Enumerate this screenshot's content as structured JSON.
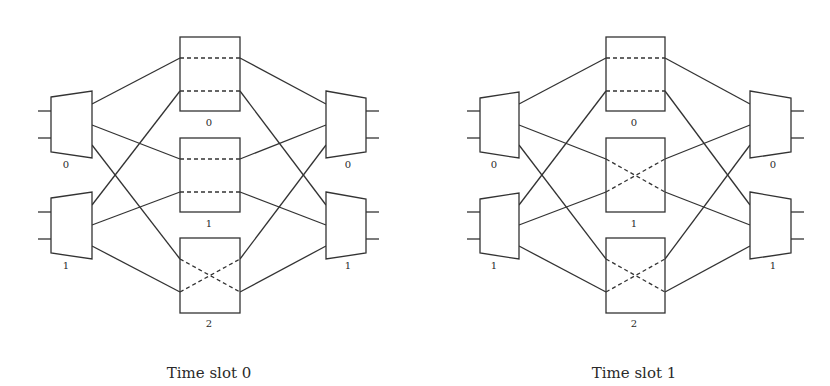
{
  "figure": {
    "colors": {
      "line": "#333333",
      "background": "#ffffff",
      "text": "#2a2a2a"
    },
    "panels": [
      {
        "id": "slot0",
        "caption": "Time slot 0",
        "input_switches": [
          {
            "label": "0"
          },
          {
            "label": "1"
          }
        ],
        "middle_switches": [
          {
            "label": "0",
            "state": "bar"
          },
          {
            "label": "1",
            "state": "bar"
          },
          {
            "label": "2",
            "state": "cross"
          }
        ],
        "output_switches": [
          {
            "label": "0"
          },
          {
            "label": "1"
          }
        ]
      },
      {
        "id": "slot1",
        "caption": "Time slot 1",
        "input_switches": [
          {
            "label": "0"
          },
          {
            "label": "1"
          }
        ],
        "middle_switches": [
          {
            "label": "0",
            "state": "bar"
          },
          {
            "label": "1",
            "state": "cross"
          },
          {
            "label": "2",
            "state": "cross"
          }
        ],
        "output_switches": [
          {
            "label": "0"
          },
          {
            "label": "1"
          }
        ]
      }
    ]
  }
}
